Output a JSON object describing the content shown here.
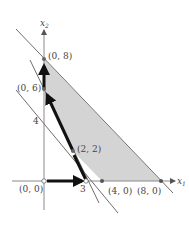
{
  "diagram": {
    "type": "linear-programming-feasible-region",
    "axes": {
      "x_label": "x",
      "x_sub": "1",
      "y_label": "x",
      "y_sub": "2"
    },
    "tick_labels": {
      "y_4": "4",
      "x_3": "3"
    },
    "points": [
      {
        "label": "(0, 8)",
        "x": 0,
        "y": 8
      },
      {
        "label": "(0, 6)",
        "x": 0,
        "y": 6
      },
      {
        "label": "(2, 2)",
        "x": 2,
        "y": 2
      },
      {
        "label": "(0, 0)",
        "x": 0,
        "y": 0
      },
      {
        "label": "(4, 0)",
        "x": 4,
        "y": 0
      },
      {
        "label": "(8, 0)",
        "x": 8,
        "y": 0
      }
    ],
    "feasible_region_vertices": [
      "(0, 8)",
      "(0, 6)",
      "(2, 2)",
      "(4, 0)",
      "(8, 0)"
    ],
    "path_arrows": [
      "(0, 0) → (3, 0)",
      "(3, 0) → (2, 2)",
      "(2, 2) → (0, 6)",
      "(0, 6) → (0, 8)"
    ],
    "colors": {
      "region_fill": "#d4d4d4",
      "line": "#6e6e6e",
      "path": "#111111",
      "axis": "#8a8a8a"
    }
  }
}
